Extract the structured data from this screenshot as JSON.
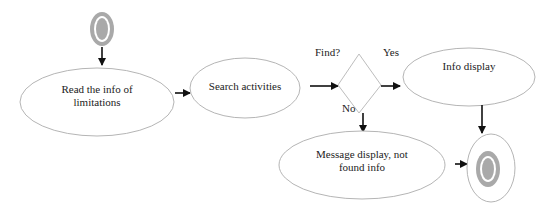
{
  "diagram": {
    "type": "activity-diagram",
    "start_node": {
      "icon": "start-state-icon"
    },
    "end_node": {
      "icon": "end-state-icon"
    },
    "nodes": [
      {
        "id": "read",
        "lines": [
          "Read the info of",
          "limitations"
        ]
      },
      {
        "id": "search",
        "lines": [
          "Search activities"
        ]
      },
      {
        "id": "info",
        "lines": [
          "Info display"
        ]
      },
      {
        "id": "message",
        "lines": [
          "Message display, not",
          "found info"
        ]
      }
    ],
    "decision": {
      "label": "Find?",
      "yes_label": "Yes",
      "no_label": "No"
    },
    "edges": [
      {
        "from": "start",
        "to": "read"
      },
      {
        "from": "read",
        "to": "search"
      },
      {
        "from": "search",
        "to": "decision"
      },
      {
        "from": "decision",
        "to": "info",
        "label": "Yes"
      },
      {
        "from": "decision",
        "to": "message",
        "label": "No"
      },
      {
        "from": "info",
        "to": "end"
      },
      {
        "from": "message",
        "to": "end"
      }
    ],
    "colors": {
      "node_stroke": "#b5b5b5",
      "state_fill": "#a9a9a9",
      "edge": "#111111"
    }
  }
}
